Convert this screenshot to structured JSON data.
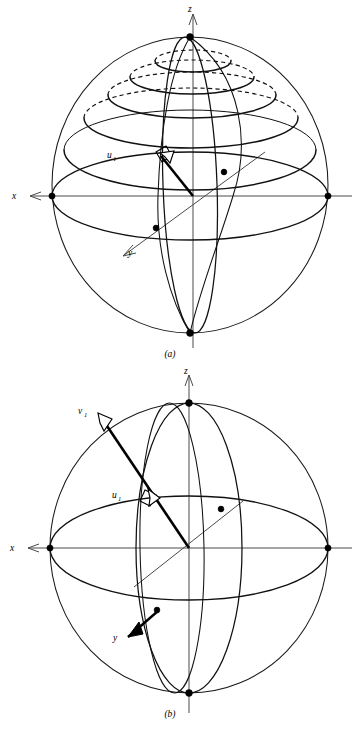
{
  "page": {
    "kind": "textbook-figure",
    "background_color": "#ffffff",
    "ink_color": "#000000",
    "axis_color": "#4a4a4a",
    "width": 358,
    "height": 730
  },
  "figures": [
    {
      "id": "a",
      "caption": "(a)",
      "axes": [
        {
          "name": "x",
          "label": "x",
          "direction": "left"
        },
        {
          "name": "y",
          "label": "y",
          "direction": "down-left"
        },
        {
          "name": "z",
          "label": "z",
          "direction": "up"
        }
      ],
      "vectors": [
        {
          "name": "u1",
          "label": "u",
          "subscript": "1",
          "head_style": "open-arrow"
        }
      ],
      "markers": {
        "right_angle": true,
        "axis_endpoint_dots": 6
      },
      "latitude_circles": {
        "count": 4,
        "back_half": "dashed",
        "front_half": "solid"
      },
      "meridians": 2,
      "sphere": {
        "center_x": 190,
        "center_y": 185,
        "radius_x": 138,
        "radius_y": 148
      }
    },
    {
      "id": "b",
      "caption": "(b)",
      "axes": [
        {
          "name": "x",
          "label": "x",
          "direction": "left"
        },
        {
          "name": "y",
          "label": "y",
          "direction": "down-left"
        },
        {
          "name": "z",
          "label": "z",
          "direction": "up"
        }
      ],
      "vectors": [
        {
          "name": "u1",
          "label": "u",
          "subscript": "1",
          "head_style": "open-arrow"
        },
        {
          "name": "v1",
          "label": "v",
          "subscript": "1",
          "head_style": "open-arrow"
        }
      ],
      "markers": {
        "right_angle": true,
        "axis_endpoint_dots": 6
      },
      "latitude_circles": {
        "count": 0
      },
      "meridians": 2,
      "sphere": {
        "center_x": 189,
        "center_y": 183,
        "radius_x": 139,
        "radius_y": 145
      }
    }
  ],
  "labels": {
    "x": "x",
    "y": "y",
    "z": "z",
    "u": "u",
    "v": "v",
    "one": "1",
    "caption_a": "(a)",
    "caption_b": "(b)"
  }
}
